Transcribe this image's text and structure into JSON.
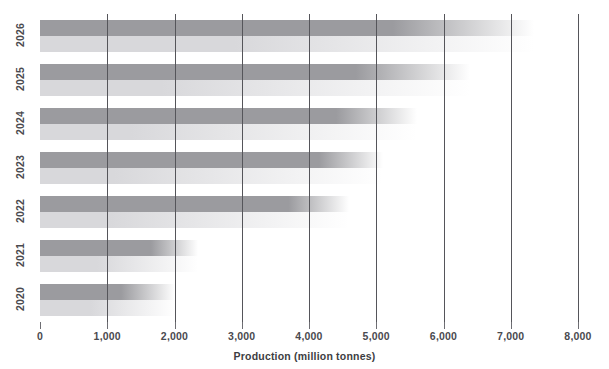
{
  "chart_data": {
    "type": "bar",
    "orientation": "horizontal",
    "title": "",
    "subtitle": "",
    "xlabel": "Production (million tonnes)",
    "ylabel": "",
    "xlim": [
      0,
      8000
    ],
    "ylim": [],
    "grid": true,
    "legend_position": "none",
    "xticks": [
      0,
      1000,
      2000,
      3000,
      4000,
      5000,
      6000,
      7000,
      8000
    ],
    "xtick_labels": [
      "0",
      "1,000",
      "2,000",
      "3,000",
      "4,000",
      "5,000",
      "6,000",
      "7,000",
      "8,000"
    ],
    "categories": [
      "2026",
      "2025",
      "2024",
      "2023",
      "2022",
      "2021",
      "2020"
    ],
    "series": [
      {
        "name": "upper",
        "color": "#9b9b9f",
        "values": [
          5250,
          4700,
          4400,
          4150,
          3700,
          1650,
          1200
        ],
        "fade_to": [
          7350,
          6400,
          5600,
          5100,
          4600,
          2350,
          2000
        ]
      },
      {
        "name": "lower",
        "color": "#d8d8db",
        "values": [
          2900,
          1800,
          1350,
          1100,
          1050,
          850,
          750
        ],
        "fade_to": [
          7350,
          6400,
          5600,
          5100,
          4600,
          2350,
          2000
        ]
      }
    ],
    "annotations": []
  },
  "axis": {
    "x_title": "Production (million tonnes)",
    "tick_labels": [
      "0",
      "1,000",
      "2,000",
      "3,000",
      "4,000",
      "5,000",
      "6,000",
      "7,000",
      "8,000"
    ],
    "year_labels": [
      "2026",
      "2025",
      "2024",
      "2023",
      "2022",
      "2021",
      "2020"
    ]
  },
  "colors": {
    "upper_bar": "#9b9b9f",
    "lower_bar": "#d8d8db",
    "gridline": "#55555a",
    "text": "#4a4a4f",
    "background": "#ffffff"
  }
}
